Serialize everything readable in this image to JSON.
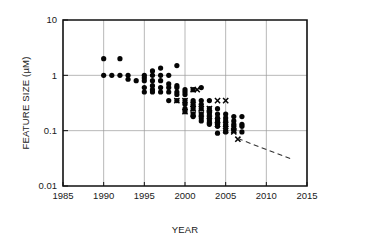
{
  "chart_data": {
    "type": "scatter",
    "title": "",
    "xlabel": "YEAR",
    "ylabel": "FEATURE SIZE (µM)",
    "xlim": [
      1985,
      2015
    ],
    "ylim": [
      0.01,
      10
    ],
    "yscale": "log",
    "xticks": [
      1985,
      1990,
      1995,
      2000,
      2005,
      2010,
      2015
    ],
    "xtick_labels": [
      "1985",
      "1990",
      "1995",
      "2000",
      "2005",
      "2010",
      "2015"
    ],
    "yticks": [
      10,
      1,
      0.1,
      0.01
    ],
    "ytick_labels": [
      "10",
      "1",
      "0.1",
      "0.01"
    ],
    "grid": true,
    "legend": "none",
    "series": [
      {
        "name": "feature-size-dot",
        "marker": "dot",
        "color": "#050505",
        "points": [
          [
            1990.0,
            2.0
          ],
          [
            1992.0,
            2.0
          ],
          [
            1990.0,
            1.0
          ],
          [
            1991.0,
            1.0
          ],
          [
            1992.0,
            1.0
          ],
          [
            1993.0,
            1.0
          ],
          [
            1993.0,
            0.85
          ],
          [
            1994.0,
            0.8
          ],
          [
            1995.0,
            1.0
          ],
          [
            1995.0,
            0.9
          ],
          [
            1995.0,
            0.8
          ],
          [
            1995.0,
            0.6
          ],
          [
            1995.0,
            0.5
          ],
          [
            1996.0,
            1.2
          ],
          [
            1996.0,
            1.0
          ],
          [
            1996.0,
            0.8
          ],
          [
            1996.0,
            0.65
          ],
          [
            1996.0,
            0.55
          ],
          [
            1996.0,
            0.5
          ],
          [
            1997.0,
            1.35
          ],
          [
            1997.0,
            1.0
          ],
          [
            1997.0,
            0.8
          ],
          [
            1997.0,
            0.6
          ],
          [
            1997.0,
            0.5
          ],
          [
            1998.0,
            1.0
          ],
          [
            1998.0,
            0.7
          ],
          [
            1998.0,
            0.6
          ],
          [
            1998.0,
            0.5
          ],
          [
            1998.0,
            0.35
          ],
          [
            1999.0,
            1.5
          ],
          [
            1999.0,
            0.65
          ],
          [
            1999.0,
            0.6
          ],
          [
            1999.0,
            0.5
          ],
          [
            1999.0,
            0.45
          ],
          [
            1999.0,
            0.35
          ],
          [
            2000.0,
            0.55
          ],
          [
            2000.0,
            0.5
          ],
          [
            2000.0,
            0.45
          ],
          [
            2000.0,
            0.35
          ],
          [
            2000.0,
            0.3
          ],
          [
            2000.0,
            0.25
          ],
          [
            2000.0,
            0.22
          ],
          [
            2001.0,
            0.55
          ],
          [
            2001.0,
            0.35
          ],
          [
            2001.0,
            0.3
          ],
          [
            2001.0,
            0.25
          ],
          [
            2001.0,
            0.2
          ],
          [
            2001.0,
            0.18
          ],
          [
            2002.0,
            0.6
          ],
          [
            2002.0,
            0.35
          ],
          [
            2002.0,
            0.3
          ],
          [
            2002.0,
            0.25
          ],
          [
            2002.0,
            0.2
          ],
          [
            2002.0,
            0.17
          ],
          [
            2002.0,
            0.15
          ],
          [
            2003.0,
            0.35
          ],
          [
            2003.0,
            0.25
          ],
          [
            2003.0,
            0.22
          ],
          [
            2003.0,
            0.2
          ],
          [
            2003.0,
            0.17
          ],
          [
            2003.0,
            0.15
          ],
          [
            2003.0,
            0.13
          ],
          [
            2004.0,
            0.25
          ],
          [
            2004.0,
            0.2
          ],
          [
            2004.0,
            0.17
          ],
          [
            2004.0,
            0.15
          ],
          [
            2004.0,
            0.13
          ],
          [
            2004.0,
            0.12
          ],
          [
            2004.0,
            0.09
          ],
          [
            2005.0,
            0.2
          ],
          [
            2005.0,
            0.17
          ],
          [
            2005.0,
            0.15
          ],
          [
            2005.0,
            0.13
          ],
          [
            2005.0,
            0.12
          ],
          [
            2005.0,
            0.1
          ],
          [
            2005.0,
            0.095
          ],
          [
            2006.0,
            0.18
          ],
          [
            2006.0,
            0.15
          ],
          [
            2006.0,
            0.13
          ],
          [
            2006.0,
            0.12
          ],
          [
            2006.0,
            0.1
          ],
          [
            2007.0,
            0.18
          ],
          [
            2007.0,
            0.13
          ],
          [
            2007.0,
            0.12
          ],
          [
            2007.0,
            0.095
          ]
        ]
      },
      {
        "name": "feature-size-cross",
        "marker": "x",
        "color": "#050505",
        "points": [
          [
            1999.0,
            0.35
          ],
          [
            2000.0,
            0.35
          ],
          [
            2000.0,
            0.22
          ],
          [
            2001.0,
            0.55
          ],
          [
            2001.0,
            0.3
          ],
          [
            2001.0,
            0.25
          ],
          [
            2001.0,
            0.2
          ],
          [
            2001.5,
            0.55
          ],
          [
            2002.0,
            0.25
          ],
          [
            2002.0,
            0.2
          ],
          [
            2003.0,
            0.25
          ],
          [
            2003.0,
            0.2
          ],
          [
            2003.0,
            0.15
          ],
          [
            2004.0,
            0.35
          ],
          [
            2004.0,
            0.15
          ],
          [
            2004.0,
            0.13
          ],
          [
            2005.0,
            0.35
          ],
          [
            2005.0,
            0.13
          ],
          [
            2005.0,
            0.1
          ],
          [
            2006.0,
            0.1
          ],
          [
            2006.0,
            0.095
          ],
          [
            2006.5,
            0.07
          ]
        ]
      }
    ],
    "trend_line": {
      "name": "projection",
      "style": "dashed",
      "points": [
        [
          2006.5,
          0.072
        ],
        [
          2013.0,
          0.031
        ]
      ]
    }
  }
}
